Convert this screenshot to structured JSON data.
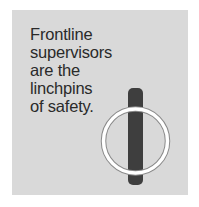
{
  "caption": {
    "lines": [
      "Frontline",
      "supervisors",
      "are the",
      "linchpins",
      "of safety."
    ]
  },
  "illustration": {
    "name": "linchpin-graphic",
    "pin_color": "#3e3e3e",
    "ring_color": "#ffffff",
    "ring_edge_color": "#8a8a8a",
    "panel_color": "#d9d9d9"
  }
}
